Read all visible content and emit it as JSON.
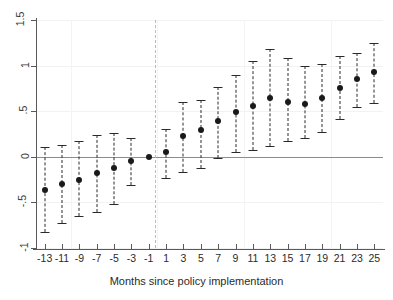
{
  "chart_data": {
    "type": "scatter",
    "title": "",
    "subtitle": "",
    "xlabel": "Months since policy implementation",
    "ylabel": "",
    "grid": true,
    "legend": null,
    "xlim": [
      -14,
      26
    ],
    "ylim": [
      -1,
      1.5
    ],
    "yticks": [
      -1,
      -0.5,
      0,
      0.5,
      1,
      1.5
    ],
    "ytick_labels": [
      "-1",
      "-.5",
      "0",
      ".5",
      "1",
      "1.5"
    ],
    "categories": [
      "-13",
      "-11",
      "-9",
      "-7",
      "-5",
      "-3",
      "-1",
      "1",
      "3",
      "5",
      "7",
      "9",
      "11",
      "13",
      "15",
      "17",
      "19",
      "21",
      "23",
      "25"
    ],
    "x": [
      -13,
      -11,
      -9,
      -7,
      -5,
      -3,
      -1,
      1,
      3,
      5,
      7,
      9,
      11,
      13,
      15,
      17,
      19,
      21,
      23,
      25
    ],
    "values": [
      -0.36,
      -0.3,
      -0.25,
      -0.18,
      -0.12,
      -0.05,
      0.0,
      0.05,
      0.23,
      0.29,
      0.39,
      0.49,
      0.56,
      0.65,
      0.6,
      0.58,
      0.65,
      0.75,
      0.85,
      0.93
    ],
    "ci_low": [
      -0.83,
      -0.73,
      -0.65,
      -0.61,
      -0.52,
      -0.31,
      0.0,
      -0.23,
      -0.17,
      -0.12,
      -0.01,
      0.05,
      0.07,
      0.12,
      0.17,
      0.21,
      0.27,
      0.41,
      0.55,
      0.59
    ],
    "ci_high": [
      0.11,
      0.13,
      0.17,
      0.24,
      0.26,
      0.21,
      0.0,
      0.31,
      0.6,
      0.62,
      0.77,
      0.9,
      1.05,
      1.18,
      1.08,
      1.0,
      1.02,
      1.1,
      1.14,
      1.25
    ],
    "reference_line_x": -0.3,
    "zero_line_y": 0,
    "marker": "filled-circle",
    "errorbar_style": "dashed-with-caps",
    "colors": {
      "marker": "#1a1a1a",
      "errorbar": "#2a2a2a",
      "zero_line": "#8c8c8c",
      "reference_line": "#bdbdbd",
      "grid": "#f2f2f2",
      "axis": "#58595b",
      "text": "#2b2b2b"
    }
  }
}
